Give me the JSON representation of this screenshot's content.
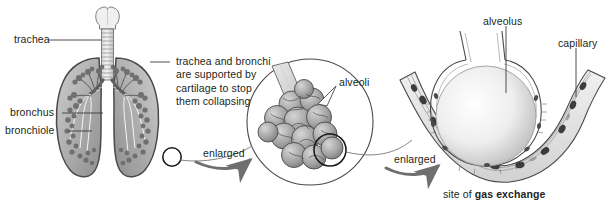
{
  "diagram": {
    "background_color": "#ffffff",
    "ink_color": "#231f20",
    "fill_light": "#e3e3e3",
    "fill_mid": "#b5b5b5",
    "fill_dark": "#8a8a8a",
    "outline_color": "#3a3a3a"
  },
  "labels": {
    "trachea": "trachea",
    "bronchus": "bronchus",
    "bronchiole": "bronchiole",
    "cartilage_note_line1": "trachea and bronchi",
    "cartilage_note_line2": "are supported by",
    "cartilage_note_line3": "cartilage to stop",
    "cartilage_note_line4": "them collapsing",
    "alveoli": "alveoli",
    "alveolus": "alveolus",
    "capillary": "capillary",
    "enlarged_1": "enlarged",
    "enlarged_2": "enlarged",
    "caption_prefix": "site of ",
    "caption_emphasis": "gas exchange"
  },
  "panels": [
    {
      "name": "lungs-panel",
      "content": "whole lungs with trachea, bronchus and bronchiole"
    },
    {
      "name": "alveoli-cluster-panel",
      "content": "cluster of alveoli at the end of a bronchiole"
    },
    {
      "name": "alveolus-capillary-panel",
      "content": "single alveolus surrounded by a capillary"
    }
  ]
}
